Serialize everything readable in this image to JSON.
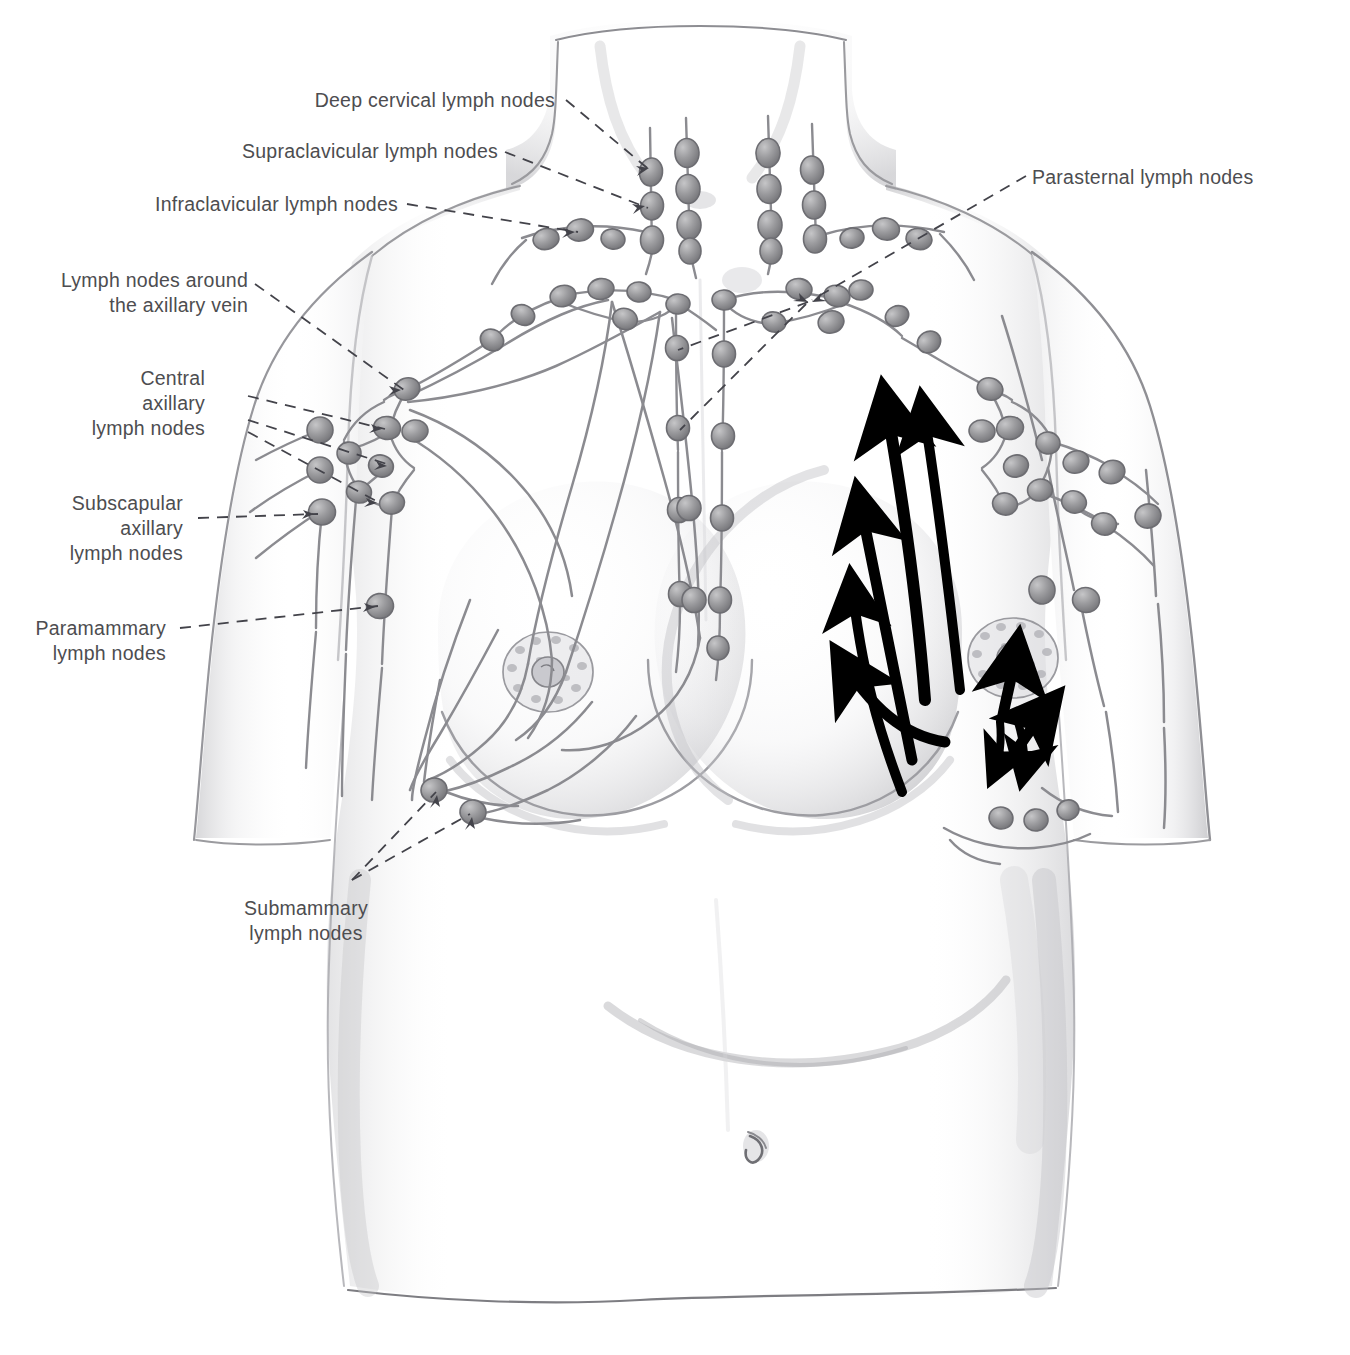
{
  "figure": {
    "type": "anatomical-illustration",
    "view": "anterior",
    "medium": "pencil drawing",
    "palette": {
      "paper": "#ffffff",
      "ink_outline": "#8d8d90",
      "ink_shadow": "#b9b9bd",
      "node_fill": "#9a9a9c",
      "node_edge": "#6d6d70",
      "vessel": "#8a8a8d",
      "arrow": "#000000",
      "leader_line": "#4a4a4d",
      "label_text": "#4d4d50"
    }
  },
  "labels": [
    {
      "id": "deep-cervical",
      "text": "Deep cervical lymph nodes",
      "lines": [
        "Deep cervical lymph nodes"
      ],
      "align": "right",
      "x": 555,
      "y": 90,
      "side": "left"
    },
    {
      "id": "supraclavicular",
      "text": "Supraclavicular lymph nodes",
      "lines": [
        "Supraclavicular lymph nodes"
      ],
      "align": "right",
      "x": 498,
      "y": 141,
      "side": "left"
    },
    {
      "id": "infraclavicular",
      "text": "Infraclavicular lymph nodes",
      "lines": [
        "Infraclavicular lymph nodes"
      ],
      "align": "right",
      "x": 398,
      "y": 194,
      "side": "left"
    },
    {
      "id": "axillary-vein",
      "text": "Lymph nodes around the axillary vein",
      "lines": [
        "Lymph nodes around",
        "the axillary vein"
      ],
      "align": "right",
      "x": 248,
      "y": 272,
      "side": "left"
    },
    {
      "id": "central-axillary",
      "text": "Central axillary lymph nodes",
      "lines": [
        "Central",
        "axillary",
        "lymph nodes"
      ],
      "align": "right",
      "x": 205,
      "y": 370,
      "side": "left"
    },
    {
      "id": "subscapular-axillary",
      "text": "Subscapular axillary lymph nodes",
      "lines": [
        "Subscapular",
        "axillary",
        "lymph nodes"
      ],
      "align": "right",
      "x": 183,
      "y": 495,
      "side": "left"
    },
    {
      "id": "paramammary",
      "text": "Paramammary lymph nodes",
      "lines": [
        "Paramammary",
        "lymph nodes"
      ],
      "align": "right",
      "x": 166,
      "y": 620,
      "side": "left"
    },
    {
      "id": "submammary",
      "text": "Submammary lymph nodes",
      "lines": [
        "Submammary",
        "lymph nodes"
      ],
      "align": "center",
      "x": 305,
      "y": 900,
      "side": "bottom"
    },
    {
      "id": "parasternal",
      "text": "Parasternal lymph nodes",
      "lines": [
        "Parasternal lymph nodes"
      ],
      "align": "left",
      "x": 1032,
      "y": 168,
      "side": "right"
    }
  ],
  "node_groups": [
    {
      "id": "deep-cervical-chains",
      "label_ref": "deep-cervical",
      "description": "four vertical cervical chains on the neck",
      "count": 15
    },
    {
      "id": "supraclavicular-chain-left",
      "label_ref": "supraclavicular",
      "description": "chain above the left clavicle",
      "count": 3
    },
    {
      "id": "supraclavicular-chain-right",
      "label_ref": "supraclavicular",
      "description": "chain above the right clavicle",
      "count": 3
    },
    {
      "id": "infraclavicular-left",
      "label_ref": "infraclavicular",
      "description": "nodes below the left clavicle",
      "count": 5
    },
    {
      "id": "infraclavicular-right",
      "label_ref": "infraclavicular",
      "description": "nodes below the right clavicle",
      "count": 5
    },
    {
      "id": "axillary-vein-nodes",
      "label_ref": "axillary-vein",
      "description": "nodes along the axillary vein",
      "count": 2
    },
    {
      "id": "central-axillary-nodes",
      "label_ref": "central-axillary",
      "description": "central axillary group",
      "count": 4
    },
    {
      "id": "subscapular-axillary-nodes",
      "label_ref": "subscapular-axillary",
      "description": "subscapular axillary chain on the arm side",
      "count": 3
    },
    {
      "id": "paramammary-nodes",
      "label_ref": "paramammary",
      "description": "node at the lateral breast margin",
      "count": 1
    },
    {
      "id": "submammary-nodes",
      "label_ref": "submammary",
      "description": "nodes at the inframammary fold",
      "count": 2
    },
    {
      "id": "parasternal-chain-left",
      "label_ref": "parasternal",
      "description": "vertical chain beside the sternum (left of midline)",
      "count": 4
    },
    {
      "id": "parasternal-chain-right",
      "label_ref": "parasternal",
      "description": "vertical chain beside the sternum (right of midline)",
      "count": 5
    }
  ],
  "drainage_arrows": {
    "description": "Thick black arrows on the subject's left breast showing lymph flow directions",
    "count": 8,
    "directions": [
      {
        "id": "arrow-to-apex-1",
        "from": "upper outer breast",
        "to": "apical axillary nodes",
        "direction": "up-left"
      },
      {
        "id": "arrow-to-apex-2",
        "from": "central breast",
        "to": "apical axillary nodes",
        "direction": "up-left"
      },
      {
        "id": "arrow-to-parasternal-1",
        "from": "medial breast",
        "to": "parasternal nodes",
        "direction": "up-left"
      },
      {
        "id": "arrow-to-parasternal-2",
        "from": "lower medial breast",
        "to": "parasternal nodes",
        "direction": "up-left"
      },
      {
        "id": "arrow-to-parasternal-3",
        "from": "inferomedial breast",
        "to": "parasternal nodes",
        "direction": "up-left"
      },
      {
        "id": "arrow-to-axilla-1",
        "from": "upper breast",
        "to": "axillary nodes",
        "direction": "up-right"
      },
      {
        "id": "arrow-to-axilla-2",
        "from": "lateral breast",
        "to": "axillary nodes",
        "direction": "up-right"
      },
      {
        "id": "arrow-to-submammary",
        "from": "lower breast",
        "to": "submammary nodes",
        "direction": "down"
      }
    ]
  },
  "anatomy_parts": [
    {
      "id": "neck",
      "name": "neck"
    },
    {
      "id": "clavicles",
      "name": "clavicles"
    },
    {
      "id": "left-arm",
      "name": "upper arm (subject's right)"
    },
    {
      "id": "right-arm",
      "name": "upper arm (subject's left)"
    },
    {
      "id": "right-breast",
      "name": "breast with lymphatic vessel network"
    },
    {
      "id": "left-breast",
      "name": "breast with drainage arrows"
    },
    {
      "id": "sternum",
      "name": "sternum / midline"
    },
    {
      "id": "abdomen",
      "name": "abdomen"
    },
    {
      "id": "umbilicus",
      "name": "umbilicus"
    }
  ]
}
